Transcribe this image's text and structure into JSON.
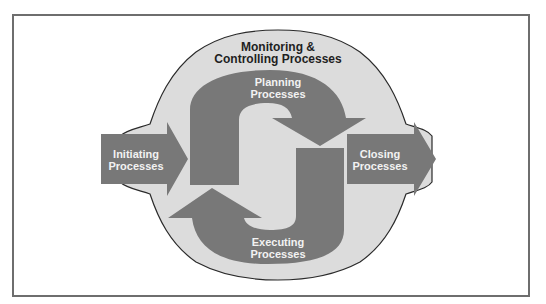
{
  "diagram": {
    "container": {
      "label_line1": "Monitoring &",
      "label_line2": "Controlling Processes"
    },
    "nodes": [
      {
        "id": "initiating",
        "line1": "Initiating",
        "line2": "Processes"
      },
      {
        "id": "planning",
        "line1": "Planning",
        "line2": "Processes"
      },
      {
        "id": "executing",
        "line1": "Executing",
        "line2": "Processes"
      },
      {
        "id": "closing",
        "line1": "Closing",
        "line2": "Processes"
      }
    ],
    "edges": [
      {
        "from": "initiating",
        "to": "planning"
      },
      {
        "from": "planning",
        "to": "executing"
      },
      {
        "from": "executing",
        "to": "planning"
      },
      {
        "from": "executing",
        "to": "closing"
      }
    ],
    "colors": {
      "frame": "#6e6e6e",
      "container_fill": "#dcdcdc",
      "container_stroke": "#2a2a2a",
      "arrow_fill": "#787878",
      "arrow_text": "#f2f2f2",
      "container_text": "#1f1f1f"
    }
  }
}
